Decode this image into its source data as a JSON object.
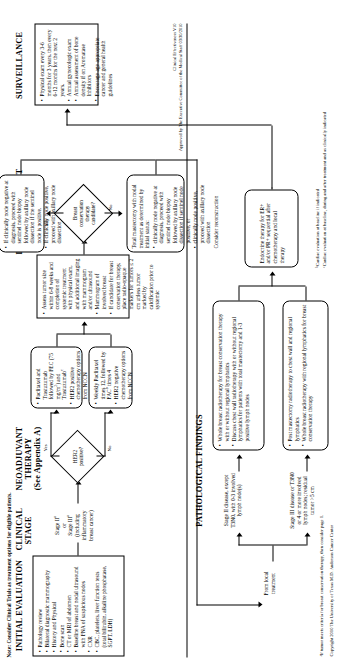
{
  "document": {
    "note": "Note: Consider Clinical Trials as treatment options for eligible patients.",
    "version_line1": "Clinical Effectiveness V10",
    "version_line2": "Approved by The Executive Committee of the Medical Staff 03/30/2010",
    "footnote_a": "ᵃIf tumor meets criteria for breast conservation therapy, then consider page 1.",
    "copyright": "Copyright 2010 The University of Texas M.D. Anderson Cancer Center",
    "footnote_b": "ᵇCardiac evaluation at baseline if indicated",
    "footnote_c": "ᶜCardiac evaluation at baseline, during and after treatment and as clinically indicated"
  },
  "columns": {
    "initial_evaluation": "INITIAL EVALUATION",
    "clinical_stage": "CLINICAL\nSTAGE",
    "neoadjuvant_therapy": "NEOADJUVANT\nTHERAPY\n(See Appendix A)",
    "local_treatment": "LOCAL TREATMENT",
    "pathological_findings": "PATHOLOGICAL FINDINGS",
    "surveillance": "SURVEILLANCE"
  },
  "initial_evaluation": {
    "items": [
      "Pathology review",
      "Bilateral diagnostic mammography",
      "History and Physical",
      "Bone scan",
      "CT or MRI of abdomen",
      "Baseline breast and nodal ultrasound with FNA of suspicious nodes",
      "CXR",
      "CBC, platelets, liver function tests (total bilirubin, alkaline phosphatase, SGPT, LDH)"
    ]
  },
  "clinical_stage": {
    "text_lines": [
      "Stage IIᵃ",
      "or",
      "Stage IIIᵃ",
      "(including",
      "inflammatory",
      "breast cancer)"
    ]
  },
  "her2_decision": {
    "label_line1": "HER2",
    "label_line2": "positive?",
    "yes": "Yes",
    "no": "No"
  },
  "neoadjuvant": {
    "her2_positive_box": [
      "Paclitaxel and Trastuzumab followed by FEC (75 mg/m²) and Trastuzumabᶜ",
      "HER2 positive chemotherapy options from NCCN"
    ],
    "her2_negative_box": [
      "Weekly Paclitaxel times 12, followed by FACᵇ times 4",
      "HER2 negative chemotherapy options from NCCN"
    ]
  },
  "bct_decision": {
    "label_line1": "Breast",
    "label_line2": "conservation",
    "label_line3": "therapy",
    "label_line4": "candidate?",
    "yes": "Yes",
    "no": "No"
  },
  "assess_tumor": {
    "items": [
      "Assess tumor size within 6-8 weeks and completion of systemic treatment with physical exam, and additional imaging with mammogram and/or ultrasound",
      "Mammogram of involved breast",
      "If candidate for breast conservation therapy, place radio-opaque markers for tumors ≤ 2 cm unless tumor marked by calcification prior to systemic"
    ]
  },
  "local_treatment": {
    "bct_box": [
      "If clinically node negative at diagnosis, proceed with sentinel node biopsy followed by axillary node dissection if the sentinel node is positive.",
      "If clinically node positive, proceed with axillary node dissection"
    ],
    "mastectomy_box": {
      "lead": "Total mastectomy with nodal treatment as determined by initial status:",
      "items": [
        "clinically node negative at diagnosis, proceed with sentinel node biopsy followed by axillary node dissection if sentinel node positive, or",
        "clinically node positive, proceed with axillary node dissection"
      ],
      "trailer": "Consider reconstruction"
    }
  },
  "pathological_findings": {
    "from_local_treatment": "From local treatment",
    "stage2_label": "Stage II disease, except T3N0, with 0-3 involved lymph node(s)",
    "stage3_label": "Stage III disease or T3N0 or 4 or more involved lymph nodes; residual tumor >5 cm",
    "stage2_box": [
      "Whole breast radiotherapy for breast conservation therapy with or without regional lymphatics",
      "Discuss chest wall radiotherapy with or without regional lymphatics for patients with total mastectomy and 1-3 positive lymph nodes"
    ],
    "stage3_box": [
      "Post mastectomy radiotherapy to chest wall and regional lymphatics",
      "Whole breast radiotherapy with regional lymphatics for breast conservation therapy"
    ]
  },
  "endocrine": {
    "text": "Endocrine therapy for ER+ and/or PR+ sequential after chemotherapy and local therapy"
  },
  "surveillance": {
    "items": [
      "Physical exam every 3-6 months for 3 years, then every 6-12 months for the next 2 years.",
      "Annual gynecologic exam",
      "Annual assessment of bone density if on Aromatase Inhibitors",
      "Encourage age appropriate cancer and general health guidelines"
    ]
  }
}
